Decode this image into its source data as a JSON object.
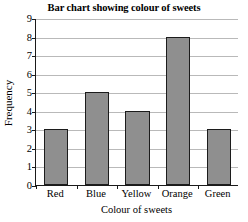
{
  "chart_data": {
    "type": "bar",
    "title": "Bar chart showing colour of sweets",
    "xlabel": "Colour of sweets",
    "ylabel": "Frequency",
    "categories": [
      "Red",
      "Blue",
      "Yellow",
      "Orange",
      "Green"
    ],
    "values": [
      3,
      5,
      4,
      8,
      3
    ],
    "ylim": [
      0,
      9
    ],
    "ytick_labels": [
      "0",
      "1",
      "2",
      "3",
      "4",
      "5",
      "6",
      "7",
      "8",
      "9"
    ],
    "ytick_values": [
      0,
      1,
      2,
      3,
      4,
      5,
      6,
      7,
      8,
      9
    ],
    "grid": true,
    "legend": false,
    "bar_fill_color": "#8f8f8f",
    "bar_edge_color": "#1c1c1c",
    "gridline_color": "#b9b9b9",
    "axis_color": "#1a1a1a",
    "background_color": "#ffffff"
  }
}
